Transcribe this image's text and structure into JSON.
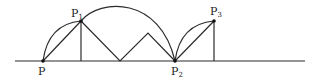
{
  "diagram": {
    "points": {
      "P": {
        "label": "P",
        "sub": ""
      },
      "P1": {
        "label": "P",
        "sub": "1"
      },
      "P2": {
        "label": "P",
        "sub": "2"
      },
      "P3": {
        "label": "P",
        "sub": "3"
      }
    },
    "colors": {
      "stroke": "#2a2a2a",
      "background": "#ffffff"
    }
  }
}
